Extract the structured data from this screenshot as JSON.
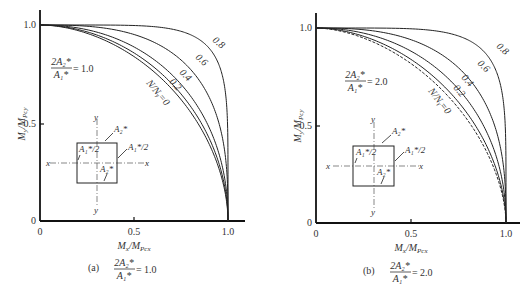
{
  "chart_data": [
    {
      "type": "line",
      "panel": "a",
      "caption_prefix": "(a)",
      "ratio_label": "2A₂*/A₁*",
      "ratio_numerator": "2A₂*",
      "ratio_denominator": "A₁*",
      "ratio_value": "1.0",
      "xlabel": "Mₓ/M_Pcx",
      "ylabel": "M_y/M_Pcy",
      "xlim": [
        0,
        1.0
      ],
      "ylim": [
        0,
        1.0
      ],
      "x_ticks": [
        "0",
        "0.5",
        "1.0"
      ],
      "y_ticks": [
        "0",
        "0.5",
        "1.0"
      ],
      "curve_family_label": "N/Nᵧ",
      "series": [
        {
          "name": "N/Nᵧ=0",
          "label": "N/Nᵧ=0",
          "exponent": 1.85,
          "dashed": false
        },
        {
          "name": "0.2",
          "label": "0.2",
          "exponent": 1.95,
          "dashed": false
        },
        {
          "name": "0.4",
          "label": "0.4",
          "exponent": 2.15,
          "dashed": false
        },
        {
          "name": "0.6",
          "label": "0.6",
          "exponent": 2.9,
          "dashed": false
        },
        {
          "name": "0.8",
          "label": "0.8",
          "exponent": 6.0,
          "dashed": false
        }
      ],
      "inset": {
        "labels": [
          "A₂*",
          "A₁*/2",
          "A₁*/2",
          "A₂*"
        ],
        "axis_x": "x",
        "axis_y": "y"
      }
    },
    {
      "type": "line",
      "panel": "b",
      "caption_prefix": "(b)",
      "ratio_label": "2A₂*/A₁*",
      "ratio_numerator": "2A₂*",
      "ratio_denominator": "A₁*",
      "ratio_value": "2.0",
      "xlabel": "Mₓ/M_Pcx",
      "ylabel": "M_y/M_Pcy",
      "xlim": [
        0,
        1.0
      ],
      "ylim": [
        0,
        1.0
      ],
      "x_ticks": [
        "0",
        "0.5",
        "1.0"
      ],
      "y_ticks": [
        "0",
        "0.5",
        "1.0"
      ],
      "curve_family_label": "N/Nᵧ",
      "series": [
        {
          "name": "N/Nᵧ=0",
          "label": "N/Nᵧ=0",
          "exponent": 1.75,
          "dashed": true
        },
        {
          "name": "0.2",
          "label": "0.2",
          "exponent": 1.85,
          "dashed": false
        },
        {
          "name": "0.4",
          "label": "0.4",
          "exponent": 2.1,
          "dashed": false
        },
        {
          "name": "0.6",
          "label": "0.6",
          "exponent": 2.7,
          "dashed": false
        },
        {
          "name": "0.8",
          "label": "0.8",
          "exponent": 5.5,
          "dashed": false
        }
      ],
      "inset": {
        "labels": [
          "A₂*",
          "A₁*/2",
          "A₁*/2",
          "A₂*"
        ],
        "axis_x": "x",
        "axis_y": "y"
      }
    }
  ]
}
